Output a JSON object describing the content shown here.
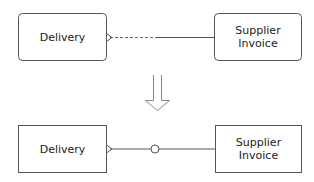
{
  "diagram": {
    "type": "er-relationship-transformation",
    "colors": {
      "stroke": "#555555",
      "arrow": "#888888",
      "text": "#222222",
      "background": "#ffffff"
    },
    "before": {
      "entities": [
        {
          "id": "delivery_top",
          "label": "Delivery",
          "corners": "rounded"
        },
        {
          "id": "supplier_invoice_top",
          "label": "Supplier\nInvoice",
          "label_line1": "Supplier",
          "label_line2": "Invoice",
          "corners": "rounded"
        }
      ],
      "relationship": {
        "from": "delivery_top",
        "to": "supplier_invoice_top",
        "from_end": "crows-foot (many)",
        "line_near_from": "dashed (optional)",
        "line_near_to": "solid (mandatory)"
      }
    },
    "transition_arrow": {
      "direction": "down",
      "style": "outline"
    },
    "after": {
      "entities": [
        {
          "id": "delivery_bottom",
          "label": "Delivery",
          "corners": "square"
        },
        {
          "id": "supplier_invoice_bottom",
          "label": "Supplier\nInvoice",
          "label_line1": "Supplier",
          "label_line2": "Invoice",
          "corners": "square"
        }
      ],
      "relationship": {
        "from": "delivery_bottom",
        "to": "supplier_invoice_bottom",
        "from_end": "crows-foot (many)",
        "middle_marker": "circle (optional)",
        "line": "solid"
      }
    }
  }
}
